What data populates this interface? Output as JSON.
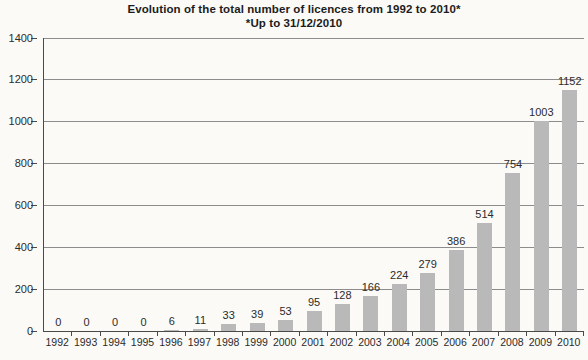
{
  "title": "Evolution of the total number of licences from 1992 to 2010*",
  "subtitle": "*Up to 31/12/2010",
  "colors": {
    "background": "#fbfaf7",
    "bar": "#b9b9b9",
    "gridline": "#8c8c8c",
    "axis": "#4a4a4a",
    "text": "#2b2b2b",
    "title_text": "#1c1c1c"
  },
  "chart_data": {
    "type": "bar",
    "title": "Evolution of the total number of licences from 1992 to 2010*",
    "subtitle": "*Up to 31/12/2010",
    "categories": [
      "1992",
      "1993",
      "1994",
      "1995",
      "1996",
      "1997",
      "1998",
      "1999",
      "2000",
      "2001",
      "2002",
      "2003",
      "2004",
      "2005",
      "2006",
      "2007",
      "2008",
      "2009",
      "2010"
    ],
    "values": [
      0,
      0,
      0,
      0,
      6,
      11,
      33,
      39,
      53,
      95,
      128,
      166,
      224,
      279,
      386,
      514,
      754,
      1003,
      1152
    ],
    "xlabel": "",
    "ylabel": "",
    "ylim": [
      0,
      1400
    ],
    "yticks": [
      0,
      200,
      400,
      600,
      800,
      1000,
      1200,
      1400
    ],
    "grid": true,
    "legend": "none",
    "bar_value_labels": true
  }
}
